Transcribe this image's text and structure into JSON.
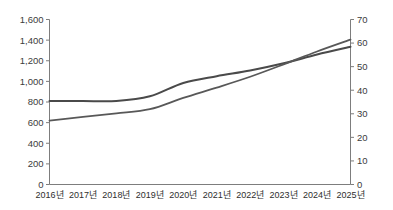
{
  "chart_data": {
    "type": "line",
    "title": "",
    "subtitle": "",
    "xlabel": "",
    "ylabel": "",
    "y2label": "",
    "grid": false,
    "legend_position": "none",
    "categories": [
      "2016년",
      "2017년",
      "2018년",
      "2019년",
      "2020년",
      "2021년",
      "2022년",
      "2023년",
      "2024년",
      "2025년"
    ],
    "ylim": [
      0,
      1600
    ],
    "yticks": [
      0,
      200,
      400,
      600,
      800,
      1000,
      1200,
      1400,
      1600
    ],
    "ytick_labels": [
      "0",
      "200",
      "400",
      "600",
      "800",
      "1,000",
      "1,200",
      "1,400",
      "1,600"
    ],
    "y2lim": [
      0,
      70
    ],
    "y2ticks": [
      0,
      10,
      20,
      30,
      40,
      50,
      60,
      70
    ],
    "y2tick_labels": [
      "0",
      "10",
      "20",
      "30",
      "40",
      "50",
      "60",
      "70"
    ],
    "series": [
      {
        "name": "series-1",
        "axis": "left",
        "color": "#4a4a4a",
        "width": 2.0,
        "values": [
          810,
          810,
          810,
          855,
          985,
          1050,
          1105,
          1175,
          1260,
          1335
        ]
      },
      {
        "name": "series-2",
        "axis": "left",
        "color": "#585858",
        "width": 1.8,
        "values": [
          620,
          655,
          690,
          730,
          840,
          940,
          1045,
          1165,
          1290,
          1405
        ]
      }
    ],
    "annotations": []
  },
  "colors": {
    "axis": "#7d7d7d",
    "text": "#2e2e2e",
    "background": "#ffffff"
  }
}
